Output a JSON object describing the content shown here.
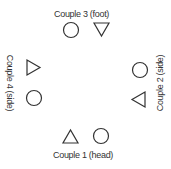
{
  "diagram": {
    "stroke_color": "#333333",
    "couples": [
      {
        "id": 1,
        "label": "Couple 1 (head)",
        "position": "bottom",
        "shapes": [
          "triangle-up",
          "circle"
        ]
      },
      {
        "id": 2,
        "label": "Couple 2 (side)",
        "position": "right",
        "shapes": [
          "circle",
          "triangle-left"
        ]
      },
      {
        "id": 3,
        "label": "Couple 3 (foot)",
        "position": "top",
        "shapes": [
          "circle",
          "triangle-down"
        ]
      },
      {
        "id": 4,
        "label": "Couple 4 (side)",
        "position": "left",
        "shapes": [
          "triangle-right",
          "circle"
        ]
      }
    ]
  }
}
